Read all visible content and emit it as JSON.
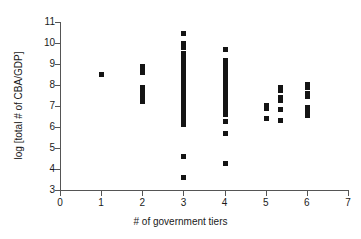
{
  "chart_data": {
    "type": "scatter",
    "title": "",
    "xlabel": "# of government tiers",
    "ylabel": "log [total # of CBA/GDP]",
    "xlim": [
      0,
      7
    ],
    "ylim": [
      3,
      11
    ],
    "xticks": [
      0,
      1,
      2,
      3,
      4,
      5,
      6,
      7
    ],
    "yticks": [
      3,
      4,
      5,
      6,
      7,
      8,
      9,
      10,
      11
    ],
    "grid": false,
    "legend": null,
    "marker": "square",
    "marker_color": "#141414",
    "points": [
      {
        "x": 1,
        "y": 8.52
      },
      {
        "x": 2,
        "y": 8.92
      },
      {
        "x": 2,
        "y": 8.78
      },
      {
        "x": 2,
        "y": 8.62
      },
      {
        "x": 2,
        "y": 7.92
      },
      {
        "x": 2,
        "y": 7.74
      },
      {
        "x": 2,
        "y": 7.56
      },
      {
        "x": 2,
        "y": 7.38
      },
      {
        "x": 2,
        "y": 7.22
      },
      {
        "x": 3,
        "y": 10.5
      },
      {
        "x": 3,
        "y": 9.98
      },
      {
        "x": 3,
        "y": 9.82
      },
      {
        "x": 3,
        "y": 9.52
      },
      {
        "x": 3,
        "y": 9.36
      },
      {
        "x": 3,
        "y": 9.2
      },
      {
        "x": 3,
        "y": 9.04
      },
      {
        "x": 3,
        "y": 8.88
      },
      {
        "x": 3,
        "y": 8.72
      },
      {
        "x": 3,
        "y": 8.56
      },
      {
        "x": 3,
        "y": 8.4
      },
      {
        "x": 3,
        "y": 8.24
      },
      {
        "x": 3,
        "y": 8.08
      },
      {
        "x": 3,
        "y": 7.92
      },
      {
        "x": 3,
        "y": 7.76
      },
      {
        "x": 3,
        "y": 7.6
      },
      {
        "x": 3,
        "y": 7.44
      },
      {
        "x": 3,
        "y": 7.28
      },
      {
        "x": 3,
        "y": 7.12
      },
      {
        "x": 3,
        "y": 6.96
      },
      {
        "x": 3,
        "y": 6.8
      },
      {
        "x": 3,
        "y": 6.64
      },
      {
        "x": 3,
        "y": 6.48
      },
      {
        "x": 3,
        "y": 6.3
      },
      {
        "x": 3,
        "y": 6.12
      },
      {
        "x": 3,
        "y": 4.62
      },
      {
        "x": 3,
        "y": 3.62
      },
      {
        "x": 4,
        "y": 9.7
      },
      {
        "x": 4,
        "y": 9.18
      },
      {
        "x": 4,
        "y": 9.02
      },
      {
        "x": 4,
        "y": 8.86
      },
      {
        "x": 4,
        "y": 8.7
      },
      {
        "x": 4,
        "y": 8.54
      },
      {
        "x": 4,
        "y": 8.38
      },
      {
        "x": 4,
        "y": 8.22
      },
      {
        "x": 4,
        "y": 8.06
      },
      {
        "x": 4,
        "y": 7.9
      },
      {
        "x": 4,
        "y": 7.74
      },
      {
        "x": 4,
        "y": 7.58
      },
      {
        "x": 4,
        "y": 7.42
      },
      {
        "x": 4,
        "y": 7.26
      },
      {
        "x": 4,
        "y": 7.1
      },
      {
        "x": 4,
        "y": 6.94
      },
      {
        "x": 4,
        "y": 6.78
      },
      {
        "x": 4,
        "y": 6.62
      },
      {
        "x": 4,
        "y": 6.3
      },
      {
        "x": 4,
        "y": 5.72
      },
      {
        "x": 4,
        "y": 4.3
      },
      {
        "x": 5,
        "y": 7.06
      },
      {
        "x": 5,
        "y": 6.9
      },
      {
        "x": 5,
        "y": 6.42
      },
      {
        "x": 5.35,
        "y": 7.92
      },
      {
        "x": 5.35,
        "y": 7.76
      },
      {
        "x": 5.35,
        "y": 7.44
      },
      {
        "x": 5.35,
        "y": 7.28
      },
      {
        "x": 5.35,
        "y": 6.86
      },
      {
        "x": 5.35,
        "y": 6.32
      },
      {
        "x": 6,
        "y": 8.06
      },
      {
        "x": 6,
        "y": 7.9
      },
      {
        "x": 6,
        "y": 7.62
      },
      {
        "x": 6,
        "y": 7.46
      },
      {
        "x": 6,
        "y": 6.96
      },
      {
        "x": 6,
        "y": 6.78
      },
      {
        "x": 6,
        "y": 6.56
      }
    ]
  },
  "axis": {
    "x_tick_labels": [
      "0",
      "1",
      "2",
      "3",
      "4",
      "5",
      "6",
      "7"
    ],
    "y_tick_labels": [
      "3",
      "4",
      "5",
      "6",
      "7",
      "8",
      "9",
      "10",
      "11"
    ],
    "x_title": "# of government tiers",
    "y_title": "log [total # of CBA/GDP]"
  }
}
